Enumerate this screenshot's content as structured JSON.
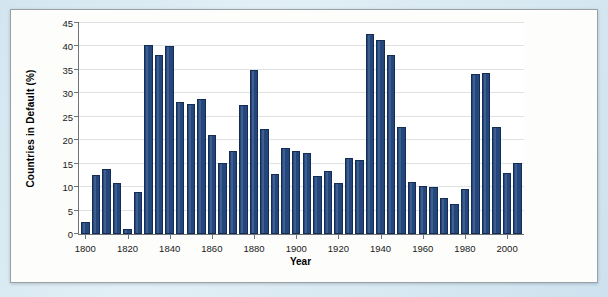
{
  "figure": {
    "panel_background": "#fdfdfb",
    "scan_background": "#d7e8f1",
    "bar_color": "#23467c",
    "axis_color": "#6f7478",
    "grid_color": "#dfe2e4"
  },
  "chart_data": {
    "type": "bar",
    "title": "",
    "xlabel": "Year",
    "ylabel": "Countries in Default (%)",
    "xlim": [
      1797,
      2008
    ],
    "ylim": [
      0,
      45
    ],
    "ytick_values": [
      0,
      5,
      10,
      15,
      20,
      25,
      30,
      35,
      40,
      45
    ],
    "ytick_labels": [
      "0",
      "5",
      "10",
      "15",
      "20",
      "25",
      "30",
      "35",
      "40",
      "45"
    ],
    "xtick_values": [
      1800,
      1820,
      1840,
      1860,
      1880,
      1900,
      1920,
      1940,
      1960,
      1980,
      2000
    ],
    "xtick_labels": [
      "1800",
      "1820",
      "1840",
      "1860",
      "1880",
      "1900",
      "1920",
      "1940",
      "1960",
      "1980",
      "2000"
    ],
    "grid": "horizontal",
    "legend": "none",
    "bar_interval_years": 5,
    "bar_width_years": 4,
    "categories": [
      1800,
      1805,
      1810,
      1815,
      1820,
      1825,
      1830,
      1835,
      1840,
      1845,
      1850,
      1855,
      1860,
      1865,
      1870,
      1875,
      1880,
      1885,
      1890,
      1895,
      1900,
      1905,
      1910,
      1915,
      1920,
      1925,
      1930,
      1935,
      1940,
      1945,
      1950,
      1955,
      1960,
      1965,
      1970,
      1975,
      1980,
      1985,
      1990,
      1995,
      2000,
      2005
    ],
    "values": [
      2.6,
      12.6,
      13.8,
      10.8,
      1.0,
      9.0,
      40.4,
      38.1,
      40.1,
      28.1,
      27.7,
      28.8,
      21.2,
      15.2,
      17.6,
      27.6,
      34.9,
      22.4,
      12.9,
      18.3,
      17.6,
      17.2,
      12.3,
      13.5,
      10.9,
      16.3,
      15.8,
      42.7,
      41.3,
      38.2,
      22.9,
      11.1,
      10.2,
      10.0,
      7.6,
      6.4,
      9.7,
      34.1,
      34.3,
      22.9,
      13.0,
      15.1
    ]
  }
}
